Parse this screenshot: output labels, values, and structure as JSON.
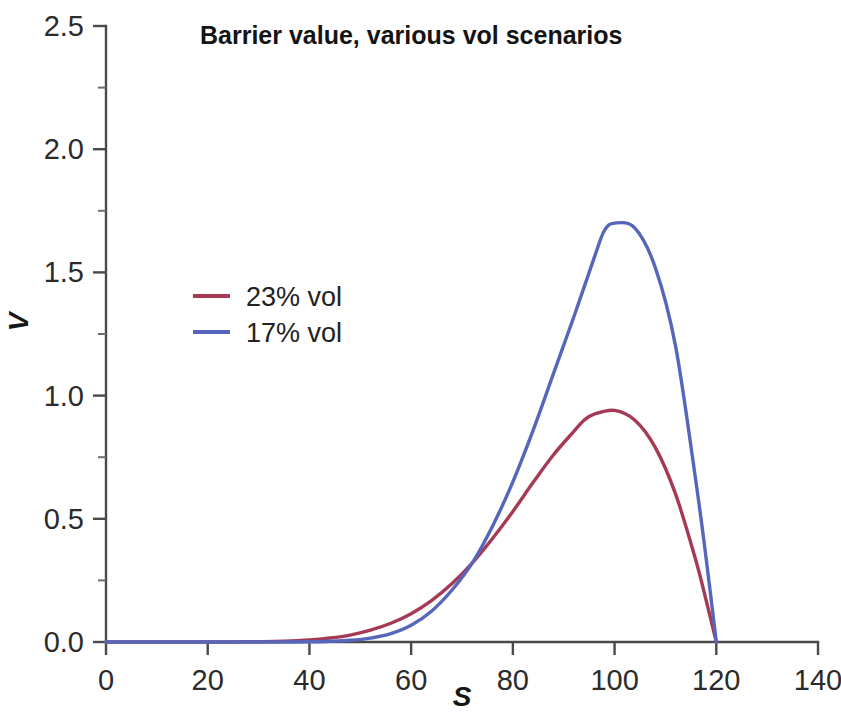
{
  "chart_data": {
    "type": "line",
    "title": "Barrier value, various vol scenarios",
    "xlabel": "S",
    "ylabel": "V",
    "xlim": [
      0,
      140
    ],
    "ylim": [
      0.0,
      2.5
    ],
    "xticks": [
      0,
      20,
      40,
      60,
      80,
      100,
      120,
      140
    ],
    "xtick_labels": [
      "0",
      "20",
      "40",
      "60",
      "80",
      "100",
      "120",
      "140"
    ],
    "yticks": [
      0.0,
      0.5,
      1.0,
      1.5,
      2.0,
      2.5
    ],
    "ytick_labels": [
      "0.0",
      "0.5",
      "1.0",
      "1.5",
      "2.0",
      "2.5"
    ],
    "yticks_minor": [
      0.25,
      0.75,
      1.25,
      1.75,
      2.25
    ],
    "grid": false,
    "legend_position": "center-left",
    "barrier_level": 120,
    "series": [
      {
        "name": "23% vol",
        "color": "#a63a55",
        "peak_x": 93,
        "peak_y": 0.94,
        "x": [
          0,
          5,
          10,
          15,
          20,
          25,
          30,
          35,
          40,
          44,
          48,
          52,
          56,
          60,
          64,
          68,
          72,
          76,
          80,
          84,
          88,
          92,
          94,
          96,
          100,
          104,
          108,
          112,
          116,
          118,
          120
        ],
        "values": [
          0.0,
          0.0,
          0.0,
          0.0,
          0.0,
          0.0,
          0.001,
          0.003,
          0.008,
          0.016,
          0.028,
          0.048,
          0.076,
          0.115,
          0.168,
          0.236,
          0.32,
          0.42,
          0.53,
          0.648,
          0.76,
          0.855,
          0.9,
          0.925,
          0.94,
          0.9,
          0.79,
          0.6,
          0.33,
          0.17,
          0.0
        ]
      },
      {
        "name": "17% vol",
        "color": "#5566bb",
        "peak_x": 98,
        "peak_y": 1.7,
        "x": [
          0,
          5,
          10,
          15,
          20,
          25,
          30,
          35,
          40,
          44,
          48,
          52,
          56,
          60,
          64,
          68,
          72,
          76,
          80,
          84,
          88,
          92,
          96,
          98,
          100,
          104,
          108,
          112,
          116,
          118,
          120
        ],
        "values": [
          0.0,
          0.0,
          0.0,
          0.0,
          0.0,
          0.0,
          0.0,
          0.0,
          0.001,
          0.003,
          0.007,
          0.016,
          0.034,
          0.068,
          0.125,
          0.21,
          0.32,
          0.47,
          0.65,
          0.86,
          1.09,
          1.32,
          1.56,
          1.67,
          1.7,
          1.68,
          1.52,
          1.2,
          0.65,
          0.34,
          0.0
        ]
      }
    ]
  },
  "legend": {
    "entries": [
      {
        "label": "23% vol",
        "color": "#a63a55"
      },
      {
        "label": "17% vol",
        "color": "#5566bb"
      }
    ]
  }
}
